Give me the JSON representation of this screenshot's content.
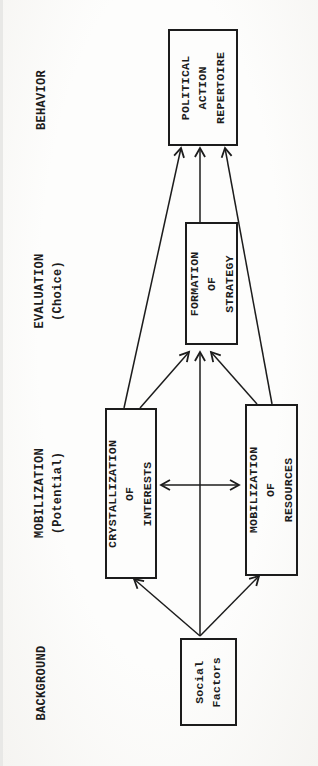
{
  "page": {
    "background_color": "#fdfdfc",
    "ink_color": "#1c1c1c",
    "orientation_note": "rotated landscape figure; all text reads bottom-to-top"
  },
  "stages": [
    {
      "id": "behavior",
      "label": "BEHAVIOR"
    },
    {
      "id": "evaluation",
      "label": "EVALUATION\n(Choice)"
    },
    {
      "id": "mobilization",
      "label": "MOBILIZATION\n(Potential)"
    },
    {
      "id": "background",
      "label": "BACKGROUND"
    }
  ],
  "nodes": {
    "political_action_repertoire": {
      "label": "POLITICAL\nACTION\nREPERTOIRE"
    },
    "formation_of_strategy": {
      "label": "FORMATION OF\nSTRATEGY"
    },
    "crystallization_of_interests": {
      "label": "CRYSTALLIZATION OF\nINTERESTS"
    },
    "mobilization_of_resources": {
      "label": "MOBILIZATION OF\nRESOURCES"
    },
    "social_factors": {
      "label": "Social\nFactors"
    }
  },
  "edges": [
    {
      "from": "social_factors",
      "to": "crystallization_of_interests",
      "type": "arrow"
    },
    {
      "from": "social_factors",
      "to": "mobilization_of_resources",
      "type": "arrow"
    },
    {
      "from": "social_factors",
      "to": "formation_of_strategy",
      "type": "arrow"
    },
    {
      "from": "crystallization_of_interests",
      "to": "mobilization_of_resources",
      "type": "double-arrow"
    },
    {
      "from": "crystallization_of_interests",
      "to": "formation_of_strategy",
      "type": "arrow"
    },
    {
      "from": "mobilization_of_resources",
      "to": "formation_of_strategy",
      "type": "arrow"
    },
    {
      "from": "crystallization_of_interests",
      "to": "political_action_repertoire",
      "type": "arrow"
    },
    {
      "from": "formation_of_strategy",
      "to": "political_action_repertoire",
      "type": "arrow"
    },
    {
      "from": "mobilization_of_resources",
      "to": "political_action_repertoire",
      "type": "arrow"
    }
  ]
}
